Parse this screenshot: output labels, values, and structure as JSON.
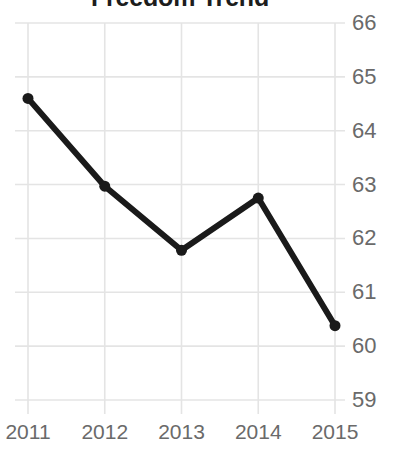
{
  "chart_data": {
    "type": "line",
    "title": "Freedom Trend",
    "xlabel": "",
    "ylabel": "",
    "categories": [
      "2011",
      "2012",
      "2013",
      "2014",
      "2015"
    ],
    "x": [
      2011,
      2012,
      2013,
      2014,
      2015
    ],
    "values": [
      64.6,
      62.97,
      61.78,
      62.75,
      60.38
    ],
    "series": [
      {
        "name": "Freedom Score",
        "values": [
          64.6,
          62.97,
          61.78,
          62.75,
          60.38
        ]
      }
    ],
    "ylim": [
      59,
      66
    ],
    "xlim": [
      2011,
      2015
    ],
    "y_ticks": [
      66,
      65,
      64,
      63,
      62,
      61,
      60,
      59
    ],
    "x_ticks": [
      "2011",
      "2012",
      "2013",
      "2014",
      "2015"
    ],
    "y_axis_position": "right",
    "grid": true,
    "legend": "none",
    "colors": {
      "line": "#1a1a1a",
      "marker": "#1a1a1a",
      "grid": "#e4e4e4",
      "tick_label": "#6a6a6a",
      "title": "#1d1d1d",
      "background": "#ffffff"
    },
    "style": {
      "line_width": 6,
      "marker_size": 11,
      "marker_shape": "circle"
    }
  }
}
